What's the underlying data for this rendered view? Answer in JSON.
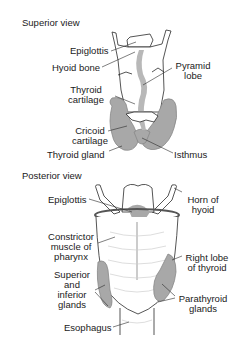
{
  "diagram": {
    "colors": {
      "gland": "#a8a8a8",
      "outline": "#2a2a2a",
      "background": "#ffffff"
    },
    "superior": {
      "title": "Superior view",
      "labels": {
        "epiglottis": "Epiglottis",
        "hyoid_bone": "Hyoid bone",
        "pyramid_lobe_1": "Pyramid",
        "pyramid_lobe_2": "lobe",
        "thyroid_cartilage_1": "Thyroid",
        "thyroid_cartilage_2": "cartilage",
        "cricoid_cartilage_1": "Cricoid",
        "cricoid_cartilage_2": "cartilage",
        "thyroid_gland": "Thyroid gland",
        "isthmus": "Isthmus"
      }
    },
    "posterior": {
      "title": "Posterior view",
      "labels": {
        "epiglottis": "Epiglottis",
        "horn_of_hyoid_1": "Horn of",
        "horn_of_hyoid_2": "hyoid",
        "constrictor_1": "Constrictor",
        "constrictor_2": "muscle of",
        "constrictor_3": "pharynx",
        "right_lobe_1": "Right lobe",
        "right_lobe_2": "of thyroid",
        "sup_inf_1": "Superior",
        "sup_inf_2": "and",
        "sup_inf_3": "inferior",
        "sup_inf_4": "glands",
        "parathyroid_1": "Parathyroid",
        "parathyroid_2": "glands",
        "esophagus": "Esophagus"
      }
    }
  }
}
